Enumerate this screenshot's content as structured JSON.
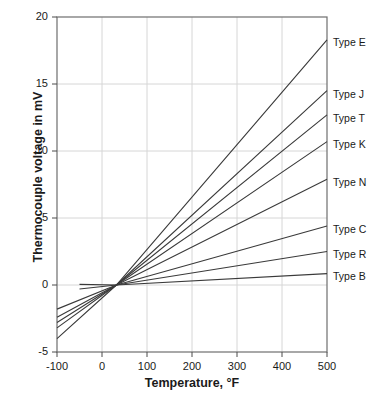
{
  "chart_data": {
    "type": "line",
    "title": "",
    "xlabel": "Temperature, °F",
    "ylabel": "Thermocouple voltage in mV",
    "xlim": [
      -100,
      500
    ],
    "ylim": [
      -5,
      20
    ],
    "xticks": [
      -100,
      0,
      100,
      200,
      300,
      400,
      500
    ],
    "xtick_labels": [
      "-100",
      "0",
      "100",
      "200",
      "300",
      "400",
      "500"
    ],
    "yticks": [
      -5,
      0,
      5,
      10,
      15,
      20
    ],
    "ytick_labels": [
      "-5",
      "0",
      "5",
      "10",
      "15",
      "20"
    ],
    "grid": true,
    "legend_position": "right-inline-labels",
    "reference_point": {
      "x": 32,
      "y": 0
    },
    "series": [
      {
        "name": "Type E",
        "label": "Type E",
        "color": "#3a3a3a",
        "x": [
          -100,
          32,
          500
        ],
        "values": [
          -4.0,
          0.0,
          18.3
        ]
      },
      {
        "name": "Type J",
        "label": "Type J",
        "color": "#3a3a3a",
        "x": [
          -100,
          32,
          500
        ],
        "values": [
          -3.2,
          0.0,
          14.5
        ]
      },
      {
        "name": "Type T",
        "label": "Type T",
        "color": "#3a3a3a",
        "x": [
          -100,
          32,
          500
        ],
        "values": [
          -2.8,
          0.0,
          12.7
        ]
      },
      {
        "name": "Type K",
        "label": "Type K",
        "color": "#3a3a3a",
        "x": [
          -100,
          32,
          500
        ],
        "values": [
          -2.4,
          0.0,
          10.7
        ]
      },
      {
        "name": "Type N",
        "label": "Type N",
        "color": "#3a3a3a",
        "x": [
          -100,
          32,
          500
        ],
        "values": [
          -1.8,
          0.0,
          7.9
        ]
      },
      {
        "name": "Type C",
        "label": "Type C",
        "color": "#3a3a3a",
        "x": [
          32,
          500
        ],
        "values": [
          0.0,
          4.4
        ]
      },
      {
        "name": "Type R",
        "label": "Type R",
        "color": "#3a3a3a",
        "x": [
          -50,
          32,
          500
        ],
        "values": [
          -0.3,
          0.0,
          2.5
        ]
      },
      {
        "name": "Type B",
        "label": "Type B",
        "color": "#3a3a3a",
        "x": [
          -50,
          32,
          500
        ],
        "values": [
          0.05,
          0.0,
          0.85
        ]
      }
    ]
  },
  "axis": {
    "y_label_text": "Thermocouple voltage in mV",
    "x_label_text": "Temperature, °F",
    "y_ticks": [
      {
        "label": "20"
      },
      {
        "label": "15"
      },
      {
        "label": "10"
      },
      {
        "label": "5"
      },
      {
        "label": "0"
      },
      {
        "label": "-5"
      }
    ],
    "x_ticks": [
      {
        "label": "-100"
      },
      {
        "label": "0"
      },
      {
        "label": "100"
      },
      {
        "label": "200"
      },
      {
        "label": "300"
      },
      {
        "label": "400"
      },
      {
        "label": "500"
      }
    ]
  },
  "series_labels": [
    {
      "label": "Type E"
    },
    {
      "label": "Type J"
    },
    {
      "label": "Type T"
    },
    {
      "label": "Type K"
    },
    {
      "label": "Type N"
    },
    {
      "label": "Type C"
    },
    {
      "label": "Type R"
    },
    {
      "label": "Type B"
    }
  ]
}
